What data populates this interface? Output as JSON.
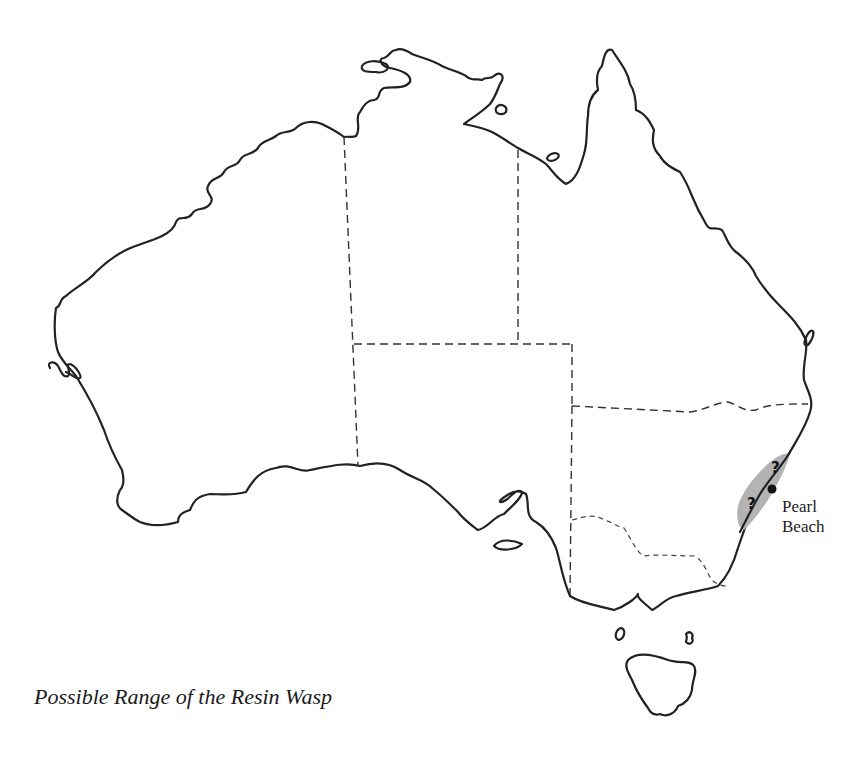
{
  "map": {
    "title": "Possible Range of the Resin Wasp",
    "subject": "Australia outline with state borders",
    "location_label": {
      "line1": "Pearl",
      "line2": "Beach"
    },
    "range_markers": [
      {
        "symbol": "?",
        "position": "north"
      },
      {
        "symbol": "?",
        "position": "south"
      }
    ],
    "point_marker": "Pearl Beach",
    "colors": {
      "coastline": "#222222",
      "state_borders": "#333333",
      "range_fill": "#b3b3b3",
      "background": "#ffffff"
    }
  }
}
